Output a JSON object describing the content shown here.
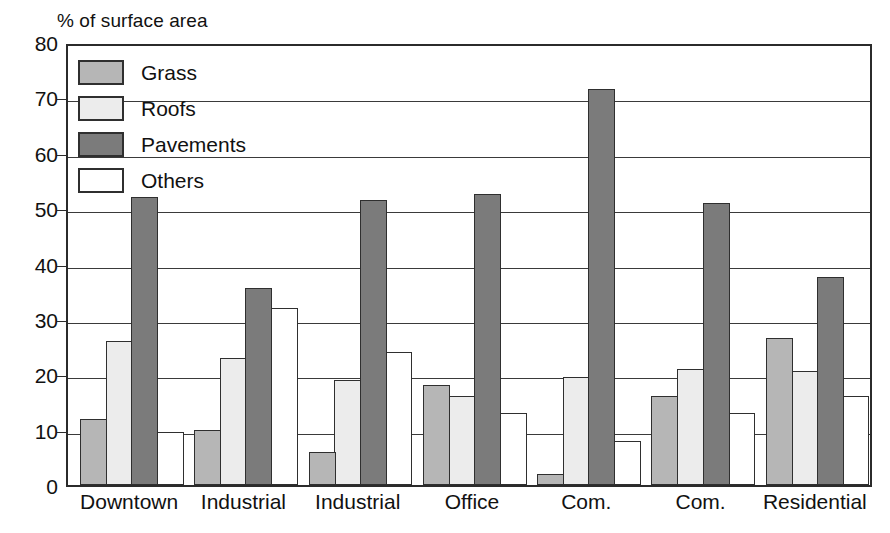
{
  "chart_data": {
    "type": "bar",
    "title": "% of surface area",
    "xlabel": "",
    "ylabel": "% of surface area",
    "ylim": [
      0,
      80
    ],
    "yticks": [
      0,
      10,
      20,
      30,
      40,
      50,
      60,
      70,
      80
    ],
    "grid": true,
    "legend_position": "upper-left-inside",
    "categories": [
      "Downtown",
      "Industrial",
      "Industrial",
      "Office",
      "Com.",
      "Com.",
      "Residential"
    ],
    "series": [
      {
        "name": "Grass",
        "color": "#b6b6b6",
        "values": [
          12,
          10,
          6,
          18,
          2,
          16,
          26.5
        ]
      },
      {
        "name": "Roofs",
        "color": "#ececec",
        "values": [
          26,
          23,
          19,
          16,
          19.5,
          21,
          20.5
        ]
      },
      {
        "name": "Pavements",
        "color": "#7b7b7b",
        "values": [
          52,
          35.5,
          51.5,
          52.5,
          71.5,
          51,
          37.5
        ]
      },
      {
        "name": "Others",
        "color": "#ffffff",
        "values": [
          9.5,
          32,
          24,
          13,
          8,
          13,
          16
        ]
      }
    ]
  },
  "legend": {
    "items": [
      {
        "label": "Grass",
        "key": "grass"
      },
      {
        "label": "Roofs",
        "key": "roofs"
      },
      {
        "label": "Pavements",
        "key": "pavements"
      },
      {
        "label": "Others",
        "key": "others"
      }
    ]
  },
  "colors": {
    "grass": "#b6b6b6",
    "roofs": "#ececec",
    "pavements": "#7b7b7b",
    "others": "#ffffff",
    "axis": "#2b2b2b",
    "grid": "#3a3a3a",
    "background": "#ffffff"
  }
}
